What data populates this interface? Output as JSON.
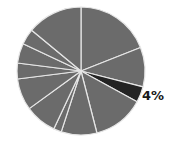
{
  "chart_data": {
    "type": "pie",
    "title": "",
    "start_angle_deg": 0,
    "direction": "clockwise",
    "values": [
      19,
      10,
      4,
      13,
      9,
      2,
      8,
      8,
      4,
      5,
      4,
      14
    ],
    "highlight_index": 2,
    "annotations": [
      {
        "slice_index": 2,
        "text": "4%"
      }
    ],
    "legend": "none"
  },
  "colors": {
    "slice": "#6b6b6b",
    "highlight": "#232323",
    "separator": "#e6e6e6",
    "background": "#ffffff"
  },
  "label": "4%"
}
